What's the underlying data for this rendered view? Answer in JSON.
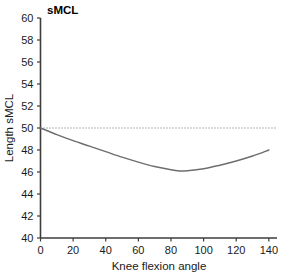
{
  "chart_data": {
    "type": "line",
    "title": "sMCL",
    "xlabel": "Knee flexion angle",
    "ylabel": "Length sMCL",
    "xlim": [
      0,
      145
    ],
    "ylim": [
      40,
      60
    ],
    "xticks": [
      0,
      20,
      40,
      60,
      80,
      100,
      120,
      140
    ],
    "xtick_labels": [
      "0",
      "20",
      "40",
      "60",
      "80",
      "100",
      "120",
      "140"
    ],
    "yticks": [
      40,
      42,
      44,
      46,
      48,
      50,
      52,
      54,
      56,
      58,
      60
    ],
    "ytick_labels": [
      "40",
      "42",
      "44",
      "46",
      "48",
      "50",
      "52",
      "54",
      "56",
      "58",
      "60"
    ],
    "grid": false,
    "legend": false,
    "series": [
      {
        "name": "sMCL length",
        "style": "solid",
        "color": "#6e6e6e",
        "x": [
          0,
          10,
          20,
          30,
          40,
          50,
          60,
          70,
          80,
          85,
          90,
          100,
          110,
          120,
          130,
          140
        ],
        "values": [
          50.0,
          49.4,
          48.85,
          48.35,
          47.85,
          47.35,
          46.9,
          46.5,
          46.2,
          46.1,
          46.12,
          46.3,
          46.62,
          47.0,
          47.45,
          48.0
        ]
      },
      {
        "name": "reference",
        "style": "dotted",
        "color": "#6e6e6e",
        "x": [
          0,
          145
        ],
        "values": [
          50.0,
          50.0
        ]
      }
    ],
    "annotations": []
  },
  "axes": {
    "title": "sMCL",
    "x_axis_label": "Knee flexion angle",
    "y_axis_label": "Length sMCL"
  }
}
